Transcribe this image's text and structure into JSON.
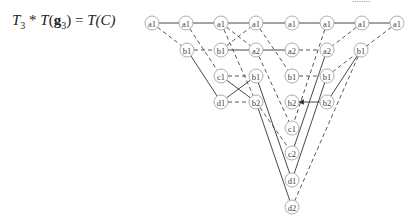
{
  "equation": {
    "lhs_T": "T",
    "lhs_sub": "3",
    "op": " * ",
    "T": "T",
    "g": "g",
    "g_sub": "3",
    "eq": " = ",
    "rhs": "T(C)"
  },
  "cut_text": "........",
  "diagram": {
    "nodes": [
      {
        "id": "n1",
        "label": "a1",
        "x": 152,
        "y": 23
      },
      {
        "id": "n2",
        "label": "a1",
        "x": 186,
        "y": 23
      },
      {
        "id": "n3",
        "label": "a1",
        "x": 221,
        "y": 23
      },
      {
        "id": "n4",
        "label": "a1",
        "x": 256,
        "y": 23
      },
      {
        "id": "n5",
        "label": "a1",
        "x": 292,
        "y": 23
      },
      {
        "id": "n6",
        "label": "a1",
        "x": 327,
        "y": 23
      },
      {
        "id": "n7",
        "label": "a1",
        "x": 362,
        "y": 23
      },
      {
        "id": "n8",
        "label": "a1",
        "x": 397,
        "y": 23
      },
      {
        "id": "n9",
        "label": "b1",
        "x": 187,
        "y": 50
      },
      {
        "id": "n10",
        "label": "b1",
        "x": 221,
        "y": 50
      },
      {
        "id": "n11",
        "label": "a2",
        "x": 256,
        "y": 50
      },
      {
        "id": "n12",
        "label": "a2",
        "x": 292,
        "y": 50
      },
      {
        "id": "n13",
        "label": "a2",
        "x": 327,
        "y": 50
      },
      {
        "id": "n14",
        "label": "b1",
        "x": 361,
        "y": 50
      },
      {
        "id": "n15",
        "label": "c1",
        "x": 221,
        "y": 76
      },
      {
        "id": "n16",
        "label": "b1",
        "x": 256,
        "y": 76
      },
      {
        "id": "n17",
        "label": "b1",
        "x": 292,
        "y": 76
      },
      {
        "id": "n18",
        "label": "b1",
        "x": 327,
        "y": 76
      },
      {
        "id": "n19",
        "label": "d1",
        "x": 221,
        "y": 102
      },
      {
        "id": "n20",
        "label": "b2",
        "x": 256,
        "y": 102
      },
      {
        "id": "n21",
        "label": "b2",
        "x": 292,
        "y": 102
      },
      {
        "id": "n22",
        "label": "b2",
        "x": 327,
        "y": 102
      },
      {
        "id": "n23",
        "label": "c1",
        "x": 292,
        "y": 128
      },
      {
        "id": "n24",
        "label": "c2",
        "x": 292,
        "y": 153
      },
      {
        "id": "n25",
        "label": "d1",
        "x": 292,
        "y": 180
      },
      {
        "id": "n26",
        "label": "d2",
        "x": 292,
        "y": 207
      }
    ],
    "edges": [
      {
        "from": "n1",
        "to": "n2",
        "style": "solid"
      },
      {
        "from": "n2",
        "to": "n3",
        "style": "solid"
      },
      {
        "from": "n3",
        "to": "n4",
        "style": "solid"
      },
      {
        "from": "n4",
        "to": "n5",
        "style": "solid"
      },
      {
        "from": "n5",
        "to": "n6",
        "style": "solid"
      },
      {
        "from": "n6",
        "to": "n7",
        "style": "solid"
      },
      {
        "from": "n7",
        "to": "n8",
        "style": "solid"
      },
      {
        "from": "n1",
        "to": "n9",
        "style": "dashed"
      },
      {
        "from": "n2",
        "to": "n15",
        "style": "dashed"
      },
      {
        "from": "n3",
        "to": "n11",
        "style": "dashed"
      },
      {
        "from": "n10",
        "to": "n4",
        "style": "dashed"
      },
      {
        "from": "n4",
        "to": "n17",
        "style": "dashed"
      },
      {
        "from": "n9",
        "to": "n10",
        "style": "dashed"
      },
      {
        "from": "n10",
        "to": "n11",
        "style": "solid"
      },
      {
        "from": "n11",
        "to": "n12",
        "style": "solid"
      },
      {
        "from": "n12",
        "to": "n13",
        "style": "dashed"
      },
      {
        "from": "n6",
        "to": "n23",
        "style": "dashed"
      },
      {
        "from": "n7",
        "to": "n13",
        "style": "dashed"
      },
      {
        "from": "n8",
        "to": "n18",
        "style": "dashed"
      },
      {
        "from": "n9",
        "to": "n19",
        "style": "solid"
      },
      {
        "from": "n3",
        "to": "n20",
        "style": "dashed"
      },
      {
        "from": "n14",
        "to": "n22",
        "style": "solid"
      },
      {
        "from": "n14",
        "to": "n26",
        "style": "dashed"
      },
      {
        "from": "n13",
        "to": "n24",
        "style": "solid"
      },
      {
        "from": "n15",
        "to": "n16",
        "style": "dashed"
      },
      {
        "from": "n15",
        "to": "n20",
        "style": "solid"
      },
      {
        "from": "n19",
        "to": "n16",
        "style": "solid"
      },
      {
        "from": "n19",
        "to": "n20",
        "style": "dashed"
      },
      {
        "from": "n16",
        "to": "n25",
        "style": "solid"
      },
      {
        "from": "n20",
        "to": "n26",
        "style": "solid"
      },
      {
        "from": "n20",
        "to": "n24",
        "style": "dashed"
      },
      {
        "from": "n17",
        "to": "n18",
        "style": "dashed"
      },
      {
        "from": "n22",
        "to": "n21",
        "style": "solid",
        "arrow": true
      },
      {
        "from": "n18",
        "to": "n25",
        "style": "solid"
      },
      {
        "from": "n11",
        "to": "n23",
        "style": "dashed"
      }
    ]
  }
}
